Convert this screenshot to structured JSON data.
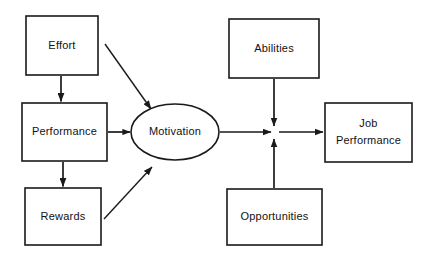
{
  "diagram": {
    "type": "flowchart",
    "background_color": "#ffffff",
    "stroke_color": "#1a1a1a",
    "text_color": "#111111",
    "nodes": [
      {
        "id": "effort",
        "label": "Effort",
        "shape": "rectangle",
        "x": 26,
        "y": 16,
        "w": 72,
        "h": 59,
        "lines": [
          "Effort"
        ]
      },
      {
        "id": "performance",
        "label": "Performance",
        "shape": "rectangle",
        "x": 22,
        "y": 103,
        "w": 85,
        "h": 58,
        "lines": [
          "Performance"
        ]
      },
      {
        "id": "rewards",
        "label": "Rewards",
        "shape": "rectangle",
        "x": 25,
        "y": 188,
        "w": 76,
        "h": 57,
        "lines": [
          "Rewards"
        ]
      },
      {
        "id": "motivation",
        "label": "Motivation",
        "shape": "ellipse",
        "cx": 175,
        "cy": 132,
        "rx": 44,
        "ry": 28,
        "lines": [
          "Motivation"
        ]
      },
      {
        "id": "abilities",
        "label": "Abilities",
        "shape": "rectangle",
        "x": 229,
        "y": 19,
        "w": 90,
        "h": 59,
        "lines": [
          "Abilities"
        ]
      },
      {
        "id": "opportunities",
        "label": "Opportunities",
        "shape": "rectangle",
        "x": 227,
        "y": 189,
        "w": 95,
        "h": 56,
        "lines": [
          "Opportunities"
        ]
      },
      {
        "id": "job-performance",
        "label": "Job Performance",
        "shape": "rectangle",
        "x": 325,
        "y": 103,
        "w": 87,
        "h": 59,
        "lines": [
          "Job",
          "Performance"
        ]
      }
    ],
    "edges": [
      {
        "id": "effort-to-performance",
        "from": "effort",
        "to": "performance",
        "style": "arrow-down"
      },
      {
        "id": "effort-to-motivation",
        "from": "effort",
        "to": "motivation",
        "style": "arrow-diagonal-down-right"
      },
      {
        "id": "performance-to-motivation",
        "from": "performance",
        "to": "motivation",
        "style": "arrow-right"
      },
      {
        "id": "performance-to-rewards",
        "from": "performance",
        "to": "rewards",
        "style": "arrow-down"
      },
      {
        "id": "rewards-to-motivation",
        "from": "rewards",
        "to": "motivation",
        "style": "arrow-diagonal-up-right"
      },
      {
        "id": "motivation-to-junction",
        "from": "motivation",
        "to": "junction",
        "style": "arrow-right"
      },
      {
        "id": "abilities-to-junction",
        "from": "abilities",
        "to": "junction",
        "style": "arrow-down"
      },
      {
        "id": "opportunities-to-junction",
        "from": "opportunities",
        "to": "junction",
        "style": "arrow-up"
      },
      {
        "id": "junction-to-job-performance",
        "from": "junction",
        "to": "job-performance",
        "style": "arrow-right"
      }
    ],
    "junction": {
      "id": "junction",
      "x": 274,
      "y": 132
    }
  }
}
